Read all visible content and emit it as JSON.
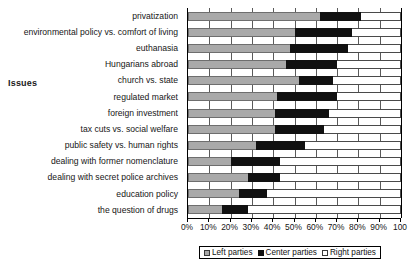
{
  "chart_data": {
    "type": "bar",
    "orientation": "horizontal",
    "stacked": true,
    "stacked_mode": "percent",
    "title": "",
    "xlabel": "",
    "ylabel": "Issues",
    "xlim": [
      0,
      100
    ],
    "grid": true,
    "legend_position": "bottom",
    "xticks": [
      "0%",
      "10%",
      "20%",
      "30%",
      "40%",
      "50%",
      "60%",
      "70%",
      "80%",
      "90%",
      "100"
    ],
    "xtick_values": [
      0,
      10,
      20,
      30,
      40,
      50,
      60,
      70,
      80,
      90,
      100
    ],
    "categories": [
      "privatization",
      "environmental policy vs. comfort of living",
      "euthanasia",
      "Hungarians abroad",
      "church vs. state",
      "regulated market",
      "foreign investment",
      "tax cuts vs. social welfare",
      "public safety vs. human rights",
      "dealing with former nomenclature",
      "dealing with secret police archives",
      "education policy",
      "the question of drugs"
    ],
    "series": [
      {
        "name": "Left parties",
        "color": "#a9a9a9",
        "values": [
          62,
          50,
          48,
          46,
          52,
          42,
          41,
          41,
          32,
          20,
          28,
          24,
          16
        ]
      },
      {
        "name": "Center parties",
        "color": "#111111",
        "values": [
          19,
          27,
          27,
          24,
          16,
          28,
          25,
          23,
          23,
          23,
          15,
          13,
          12
        ]
      },
      {
        "name": "Right parties",
        "color": "#ffffff",
        "values": [
          19,
          23,
          25,
          30,
          32,
          30,
          34,
          36,
          45,
          57,
          57,
          63,
          72
        ]
      }
    ]
  }
}
